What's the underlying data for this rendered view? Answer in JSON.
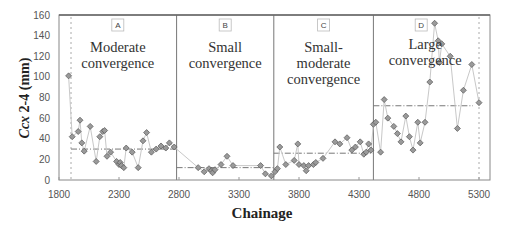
{
  "chart_data": {
    "type": "line",
    "title": "",
    "xlabel": "Chainage",
    "ylabel": "Ccx 2-4 (mm)",
    "ylabel_parts": {
      "italic": "Ccx",
      "rest": " 2-4 (mm)"
    },
    "xlim": [
      1800,
      5400
    ],
    "ylim": [
      0,
      160
    ],
    "x_ticks": [
      1800,
      2300,
      2800,
      3300,
      3800,
      4300,
      4800,
      5300
    ],
    "y_ticks": [
      0,
      20,
      40,
      60,
      80,
      100,
      120,
      140,
      160
    ],
    "grid": false,
    "legend": null,
    "regions": [
      {
        "id": "A",
        "label": "Moderate convergence",
        "lines": [
          "Moderate",
          "convergence"
        ],
        "x_start": 1800,
        "x_end": 2780,
        "mean": 30
      },
      {
        "id": "B",
        "label": "Small convergence",
        "lines": [
          "Small",
          "convergence"
        ],
        "x_start": 2780,
        "x_end": 3590,
        "mean": 12
      },
      {
        "id": "C",
        "label": "Small-moderate convergence",
        "lines": [
          "Small-",
          "moderate",
          "convergence"
        ],
        "x_start": 3590,
        "x_end": 4420,
        "mean": 26
      },
      {
        "id": "D",
        "label": "Large convergence",
        "lines": [
          "Large",
          "convergence"
        ],
        "x_start": 4420,
        "x_end": 5350,
        "mean": 72
      }
    ],
    "reference_lines_x": [
      1900,
      5300
    ],
    "series": [
      {
        "name": "Ccx 2-4",
        "x": [
          1880,
          1910,
          1960,
          1975,
          1990,
          2010,
          2060,
          2110,
          2140,
          2165,
          2180,
          2200,
          2230,
          2280,
          2300,
          2310,
          2320,
          2340,
          2360,
          2410,
          2460,
          2500,
          2530,
          2570,
          2610,
          2650,
          2690,
          2720,
          2760,
          2960,
          3010,
          3050,
          3070,
          3080,
          3100,
          3150,
          3200,
          3250,
          3480,
          3520,
          3570,
          3600,
          3620,
          3640,
          3690,
          3760,
          3790,
          3800,
          3840,
          3860,
          3880,
          3920,
          3940,
          4000,
          4100,
          4140,
          4200,
          4240,
          4270,
          4310,
          4340,
          4360,
          4380,
          4400,
          4420,
          4440,
          4480,
          4510,
          4540,
          4590,
          4620,
          4650,
          4690,
          4720,
          4750,
          4790,
          4810,
          4850,
          4890,
          4930,
          4960,
          4970,
          4990,
          5060,
          5120,
          5170,
          5240,
          5300
        ],
        "values": [
          101,
          42,
          47,
          58,
          36,
          28,
          52,
          18,
          42,
          47,
          48,
          23,
          27,
          18,
          15,
          17,
          14,
          12,
          31,
          27,
          12,
          38,
          46,
          27,
          30,
          33,
          31,
          36,
          32,
          12,
          8,
          11,
          9,
          7,
          10,
          15,
          23,
          14,
          14,
          6,
          4,
          8,
          11,
          32,
          15,
          19,
          35,
          15,
          14,
          9,
          14,
          15,
          17,
          21,
          37,
          35,
          41,
          29,
          32,
          37,
          25,
          27,
          35,
          29,
          54,
          56,
          27,
          78,
          60,
          52,
          45,
          37,
          62,
          42,
          29,
          56,
          36,
          56,
          95,
          152,
          135,
          114,
          132,
          120,
          50,
          87,
          112,
          75
        ]
      }
    ]
  }
}
